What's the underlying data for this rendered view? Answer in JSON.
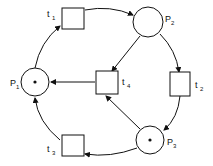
{
  "diagram": {
    "type": "petri-net",
    "places": [
      {
        "id": "p1",
        "label": "P",
        "sub": "1",
        "tokens": 1
      },
      {
        "id": "p2",
        "label": "P",
        "sub": "2",
        "tokens": 0
      },
      {
        "id": "p3",
        "label": "P",
        "sub": "3",
        "tokens": 1
      }
    ],
    "transitions": [
      {
        "id": "t1",
        "label": "t",
        "sub": "1"
      },
      {
        "id": "t2",
        "label": "t",
        "sub": "2"
      },
      {
        "id": "t3",
        "label": "t",
        "sub": "3"
      },
      {
        "id": "t4",
        "label": "t",
        "sub": "4"
      }
    ],
    "arcs": [
      {
        "from": "p1",
        "to": "t1"
      },
      {
        "from": "t1",
        "to": "p2"
      },
      {
        "from": "p2",
        "to": "t2"
      },
      {
        "from": "t2",
        "to": "p3"
      },
      {
        "from": "p3",
        "to": "t3"
      },
      {
        "from": "t3",
        "to": "p1"
      },
      {
        "from": "p2",
        "to": "t4"
      },
      {
        "from": "p3",
        "to": "t4"
      },
      {
        "from": "t4",
        "to": "p1"
      }
    ]
  }
}
